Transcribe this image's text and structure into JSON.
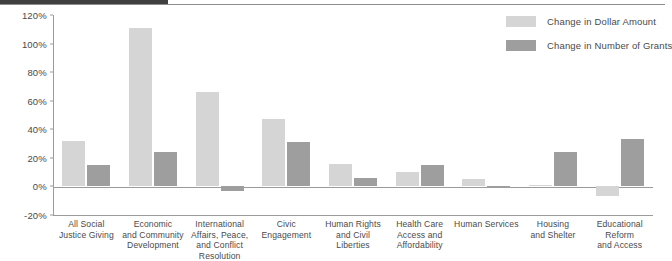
{
  "chart_data": {
    "type": "bar",
    "title": "",
    "xlabel": "",
    "ylabel": "",
    "ylim": [
      -20,
      120
    ],
    "ytick_step": 20,
    "ytick_labels": [
      "120%",
      "100%",
      "80%",
      "60%",
      "40%",
      "20%",
      "0%",
      "-20%"
    ],
    "ytick_values": [
      120,
      100,
      80,
      60,
      40,
      20,
      0,
      -20
    ],
    "grid": false,
    "legend_position": "top-right",
    "categories": [
      "All Social Justice Giving",
      "Economic and Community Development",
      "International Affairs, Peace, and Conflict Resolution",
      "Civic Engagement",
      "Human Rights and Civil Liberties",
      "Health Care Access and Affordability",
      "Human Services",
      "Housing and Shelter",
      "Educational Reform and Access"
    ],
    "category_lines": [
      [
        "All Social",
        "Justice Giving"
      ],
      [
        "Economic",
        "and Community",
        "Development"
      ],
      [
        "International",
        "Affairs, Peace,",
        "and Conflict",
        "Resolution"
      ],
      [
        "Civic",
        "Engagement"
      ],
      [
        "Human Rights",
        "and Civil",
        "Liberties"
      ],
      [
        "Health Care",
        "Access and",
        "Affordability"
      ],
      [
        "Human Services"
      ],
      [
        "Housing",
        "and Shelter"
      ],
      [
        "Educational",
        "Reform",
        "and Access"
      ]
    ],
    "series": [
      {
        "name": "Change in Dollar Amount",
        "color": "#d5d5d5",
        "values": [
          32,
          111,
          66,
          47,
          16,
          10,
          5,
          1,
          -7
        ]
      },
      {
        "name": "Change in Number of Grants",
        "color": "#9e9e9e",
        "values": [
          15,
          24,
          -3,
          31,
          6,
          15,
          -1,
          24,
          33
        ]
      }
    ]
  },
  "legend": {
    "items": [
      {
        "label": "Change in Dollar Amount",
        "swatch": "light"
      },
      {
        "label": "Change in Number of Grants",
        "swatch": "dark"
      }
    ]
  }
}
